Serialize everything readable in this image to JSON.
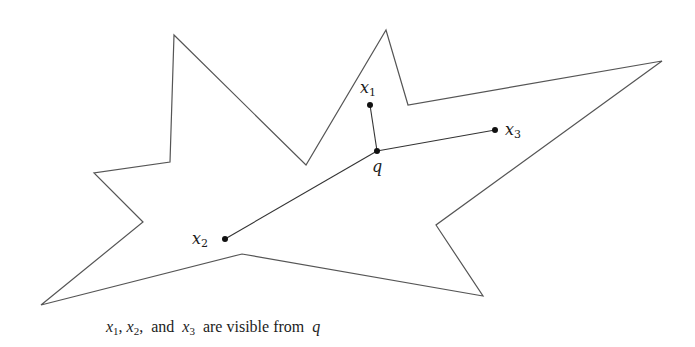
{
  "figure": {
    "stroke_color": "#555555",
    "segment_color": "#333333",
    "point_color": "#111111",
    "polygon_vertices": [
      [
        174,
        35
      ],
      [
        306,
        165
      ],
      [
        386,
        30
      ],
      [
        408,
        105
      ],
      [
        662,
        61
      ],
      [
        436,
        225
      ],
      [
        483,
        296
      ],
      [
        242,
        254
      ],
      [
        41,
        305
      ],
      [
        143,
        222
      ],
      [
        94,
        173
      ],
      [
        170,
        162
      ]
    ],
    "points": {
      "q": {
        "x": 377,
        "y": 151
      },
      "x1": {
        "x": 370,
        "y": 105
      },
      "x2": {
        "x": 225,
        "y": 239
      },
      "x3": {
        "x": 495,
        "y": 130
      }
    },
    "segments": [
      [
        "q",
        "x1"
      ],
      [
        "q",
        "x2"
      ],
      [
        "q",
        "x3"
      ]
    ]
  },
  "labels": {
    "x1": {
      "base": "x",
      "sub": "1"
    },
    "x2": {
      "base": "x",
      "sub": "2"
    },
    "x3": {
      "base": "x",
      "sub": "3"
    },
    "q": {
      "base": "q"
    }
  },
  "caption": {
    "v1": "x",
    "s1": "1",
    "sep1": ", ",
    "v2": "x",
    "s2": "2",
    "sep2": ",  and  ",
    "v3": "x",
    "s3": "3",
    "text": "  are visible from  ",
    "v4": "q",
    "full": "x1, x2, and x3 are visible from q"
  }
}
